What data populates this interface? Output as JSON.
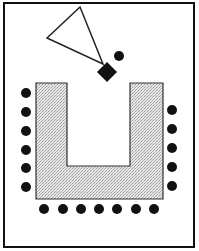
{
  "diagram": {
    "type": "seating-layout",
    "colors": {
      "ink": "#111111",
      "table_fill": "#d9d9d9",
      "background": "#ffffff"
    },
    "frame": {
      "x": 4,
      "y": 3,
      "width": 190,
      "height": 244
    },
    "projector_triangle": {
      "points": "80,7 47,38 103,64"
    },
    "presenter_diamond": {
      "cx": 107,
      "cy": 72,
      "half": 10
    },
    "presenter_seat": {
      "cx": 119,
      "cy": 56,
      "r": 5
    },
    "u_table": {
      "path": "M36,83 L67,83 L67,166 L130,166 L130,83 L163,83 L163,199 L36,199 Z"
    },
    "seats": {
      "radius": 5,
      "left": [
        [
          26,
          93
        ],
        [
          26,
          112
        ],
        [
          26,
          131
        ],
        [
          26,
          150
        ],
        [
          26,
          168
        ],
        [
          26,
          187
        ]
      ],
      "right": [
        [
          172,
          110
        ],
        [
          172,
          129
        ],
        [
          172,
          148
        ],
        [
          172,
          167
        ],
        [
          172,
          186
        ]
      ],
      "bottom": [
        [
          44,
          209
        ],
        [
          63,
          209
        ],
        [
          81,
          209
        ],
        [
          99,
          209
        ],
        [
          117,
          209
        ],
        [
          136,
          209
        ],
        [
          154,
          209
        ]
      ]
    }
  }
}
